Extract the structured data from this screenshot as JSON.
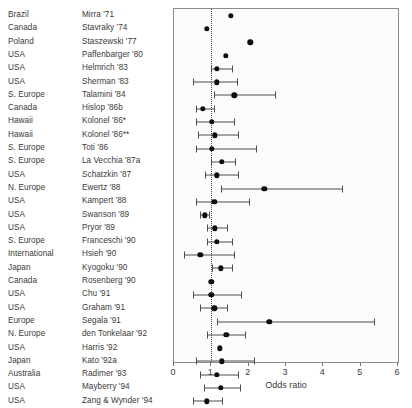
{
  "chart_data": {
    "type": "scatter",
    "title": "",
    "xlabel": "Odds ratio",
    "ylabel": "",
    "xlim": [
      0,
      6
    ],
    "xticks": [
      0,
      1,
      2,
      3,
      4,
      5,
      6
    ],
    "xtick_labels": [
      "0",
      "1",
      "2",
      "3",
      "4",
      "5",
      "6"
    ],
    "grid": false,
    "legend": "none",
    "reference_line": 1.0,
    "orientation": "horizontal-forest",
    "columns": [
      "Country",
      "Study",
      "Odds ratio",
      "CI low",
      "CI high"
    ],
    "rows": [
      {
        "country": "Brazil",
        "study": "Mirra '71",
        "or": 1.52,
        "ci_low": null,
        "ci_high": null
      },
      {
        "country": "Canada",
        "study": "Stavraky '74",
        "or": 0.88,
        "ci_low": null,
        "ci_high": null
      },
      {
        "country": "Poland",
        "study": "Staszewski '77",
        "or": 2.04,
        "ci_low": null,
        "ci_high": null
      },
      {
        "country": "USA",
        "study": "Paffenbarger '80",
        "or": 1.38,
        "ci_low": null,
        "ci_high": null
      },
      {
        "country": "USA",
        "study": "Helmrich '83",
        "or": 1.15,
        "ci_low": 1.0,
        "ci_high": 1.55
      },
      {
        "country": "USA",
        "study": "Sherman '83",
        "or": 1.15,
        "ci_low": 0.52,
        "ci_high": 1.7
      },
      {
        "country": "S. Europe",
        "study": "Talamini '84",
        "or": 1.62,
        "ci_low": 1.06,
        "ci_high": 2.7
      },
      {
        "country": "Canada",
        "study": "Hislop '86b",
        "or": 0.77,
        "ci_low": 0.59,
        "ci_high": 1.08
      },
      {
        "country": "Hawaii",
        "study": "Kolonel '86*",
        "or": 1.02,
        "ci_low": 0.58,
        "ci_high": 1.62
      },
      {
        "country": "Hawaii",
        "study": "Kolonel '86**",
        "or": 1.09,
        "ci_low": 0.63,
        "ci_high": 1.72
      },
      {
        "country": "S. Europe",
        "study": "Toti '86",
        "or": 1.02,
        "ci_low": 0.58,
        "ci_high": 2.2
      },
      {
        "country": "S. Europe",
        "study": "La Vecchia '87a",
        "or": 1.28,
        "ci_low": 1.0,
        "ci_high": 1.63
      },
      {
        "country": "USA",
        "study": "Schatzkin '87",
        "or": 1.15,
        "ci_low": 0.82,
        "ci_high": 1.72
      },
      {
        "country": "N. Europe",
        "study": "Ewertz '88",
        "or": 2.42,
        "ci_low": 1.26,
        "ci_high": 4.5
      },
      {
        "country": "USA",
        "study": "Kampert '88",
        "or": 1.08,
        "ci_low": 0.58,
        "ci_high": 2.0
      },
      {
        "country": "USA",
        "study": "Swanson '89",
        "or": 0.82,
        "ci_low": 0.7,
        "ci_high": 0.95
      },
      {
        "country": "USA",
        "study": "Pryor '89",
        "or": 1.1,
        "ci_low": 0.88,
        "ci_high": 1.42
      },
      {
        "country": "S. Europe",
        "study": "Franceschi '90",
        "or": 1.15,
        "ci_low": 0.88,
        "ci_high": 1.55
      },
      {
        "country": "International",
        "study": "Hsieh '90",
        "or": 0.7,
        "ci_low": 0.28,
        "ci_high": 1.62
      },
      {
        "country": "Japan",
        "study": "Kyogoku '90",
        "or": 1.25,
        "ci_low": 1.02,
        "ci_high": 1.55
      },
      {
        "country": "Canada",
        "study": "Rosenberg '90",
        "or": 1.0,
        "ci_low": null,
        "ci_high": null
      },
      {
        "country": "USA",
        "study": "Chu '91",
        "or": 1.0,
        "ci_low": 0.52,
        "ci_high": 1.8
      },
      {
        "country": "USA",
        "study": "Graham '91",
        "or": 1.08,
        "ci_low": 0.7,
        "ci_high": 1.42
      },
      {
        "country": "Europe",
        "study": "Segala '91",
        "or": 2.55,
        "ci_low": 1.15,
        "ci_high": 5.35
      },
      {
        "country": "N. Europe",
        "study": "den Tonkelaar '92",
        "or": 1.4,
        "ci_low": 0.88,
        "ci_high": 1.9
      },
      {
        "country": "USA",
        "study": "Harris '92",
        "or": 1.22,
        "ci_low": null,
        "ci_high": null
      },
      {
        "country": "Japan",
        "study": "Kato '92a",
        "or": 1.28,
        "ci_low": 0.58,
        "ci_high": 2.15
      },
      {
        "country": "Australia",
        "study": "Radimer '93",
        "or": 1.15,
        "ci_low": 0.7,
        "ci_high": 1.72
      },
      {
        "country": "USA",
        "study": "Mayberry '94",
        "or": 1.25,
        "ci_low": 0.8,
        "ci_high": 1.78
      },
      {
        "country": "USA",
        "study": "Zang & Wynder '94",
        "or": 0.88,
        "ci_low": 0.52,
        "ci_high": 1.28
      }
    ],
    "extra_rows": [
      {
        "country": "USA",
        "study": "",
        "or": 0.75,
        "ci_low": 0.45,
        "ci_high": 1.02
      },
      {
        "country": "USA",
        "study": "",
        "or": 1.45,
        "ci_low": 1.0,
        "ci_high": 2.05
      }
    ],
    "colors": {
      "marker": "#0d0d0d",
      "ci": "#4d4d4d",
      "frame": "#8a8a8a",
      "reference": "#4a4a4a",
      "background": "#fcfcfc",
      "text": "#3a3a3a"
    }
  },
  "layout": {
    "plot_left": 173,
    "plot_top": 8,
    "plot_width": 226,
    "plot_height": 355,
    "row_height": 13.3,
    "first_row_center": 8
  }
}
